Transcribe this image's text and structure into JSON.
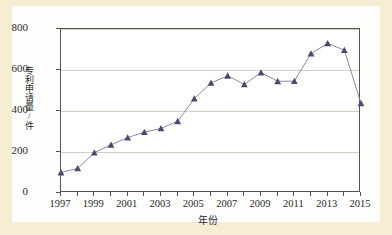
{
  "chart_data": {
    "type": "line",
    "title": "",
    "subtitle": "",
    "xlabel": "年份",
    "ylabel": "专利申请量/件",
    "xlim": [
      1997,
      2015
    ],
    "ylim": [
      0,
      800
    ],
    "yticks": [
      0,
      200,
      400,
      600,
      800
    ],
    "xticks": [
      1997,
      1999,
      2001,
      2003,
      2005,
      2007,
      2009,
      2011,
      2013,
      2015
    ],
    "xtick_labels": [
      "1997",
      "1999",
      "2001",
      "2003",
      "2005",
      "2007",
      "2009",
      "2011",
      "2013",
      "2015"
    ],
    "ytick_labels": [
      "0",
      "200",
      "400",
      "600",
      "800"
    ],
    "grid": true,
    "grid_axis": "y",
    "legend": false,
    "legend_position": "none",
    "marker": "triangle",
    "x": [
      1997,
      1998,
      1999,
      2000,
      2001,
      2002,
      2003,
      2004,
      2005,
      2006,
      2007,
      2008,
      2009,
      2010,
      2011,
      2012,
      2013,
      2014,
      2015
    ],
    "categories": [
      "1997",
      "1998",
      "1999",
      "2000",
      "2001",
      "2002",
      "2003",
      "2004",
      "2005",
      "2006",
      "2007",
      "2008",
      "2009",
      "2010",
      "2011",
      "2012",
      "2013",
      "2014",
      "2015"
    ],
    "values": [
      100,
      120,
      197,
      235,
      270,
      297,
      315,
      350,
      460,
      537,
      572,
      530,
      587,
      545,
      546,
      680,
      730,
      697,
      437
    ],
    "series": [
      {
        "name": "专利申请量",
        "values": [
          100,
          120,
          197,
          235,
          270,
          297,
          315,
          350,
          460,
          537,
          572,
          530,
          587,
          545,
          546,
          680,
          730,
          697,
          437
        ]
      }
    ],
    "colors": {
      "marker": "#4a4a6e",
      "line": "#7a7a9a",
      "grid": "#cfcfc2",
      "axis": "#55554e",
      "page_background": "#f6eed2",
      "panel_background": "#fdfdfb",
      "plot_background": "#ffffff",
      "text": "#2b2b2b"
    }
  }
}
